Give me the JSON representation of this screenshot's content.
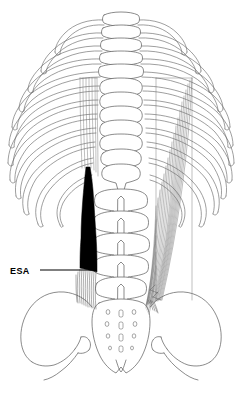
{
  "figure": {
    "background_color": "#ffffff",
    "line_color": "#595959",
    "highlight_color": "#000000"
  },
  "annotations": [
    {
      "id": "esa",
      "label": "ESA",
      "meaning": "erector spinae aponeurosis",
      "leader_from_x": 52,
      "leader_from_y": 270,
      "leader_to_x": 92,
      "leader_to_y": 270
    }
  ],
  "structures": {
    "ribcage_label": "rib cage",
    "thoracic_vertebrae_label": "thoracic vertebrae",
    "lumbar_vertebrae_label": "lumbar vertebrae",
    "sacrum_label": "sacrum",
    "ilium_left_label": "left ilium",
    "ilium_right_label": "right ilium",
    "muscle_left_label": "erector spinae aponeurosis shaded",
    "muscle_right_label": "erector spinae muscle fibers"
  },
  "counts": {
    "rib_pairs": 12,
    "thoracic_vertebrae": 12,
    "lumbar_vertebrae": 5,
    "sacral_foramina_pairs": 4
  }
}
